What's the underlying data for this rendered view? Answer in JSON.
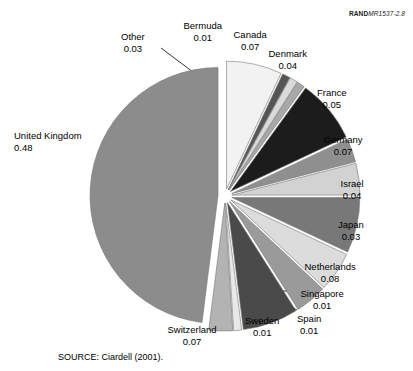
{
  "figure": {
    "rand_id_bold": "RAND",
    "rand_id_italic": "MR1537-2.8",
    "source_note": "SOURCE: Ciardell (2001)."
  },
  "chart_data": {
    "type": "pie",
    "title": "",
    "exploded": true,
    "start_angle_deg": 90,
    "direction": "counterclockwise",
    "categories": [
      "United Kingdom",
      "Other",
      "Bermuda",
      "Canada",
      "Denmark",
      "France",
      "Germany",
      "Israel",
      "Japan",
      "Netherlands",
      "Singapore",
      "Spain",
      "Sweden",
      "Switzerland"
    ],
    "values": [
      0.48,
      0.03,
      0.01,
      0.07,
      0.04,
      0.05,
      0.07,
      0.04,
      0.03,
      0.08,
      0.01,
      0.01,
      0.01,
      0.07
    ],
    "slices": [
      {
        "label": "United Kingdom",
        "value": 0.48,
        "value_text": "0.48",
        "color": "#8c8c8c"
      },
      {
        "label": "Other",
        "value": 0.03,
        "value_text": "0.03",
        "color": "#b3b3b3"
      },
      {
        "label": "Bermuda",
        "value": 0.01,
        "value_text": "0.01",
        "color": "#e8e8e8"
      },
      {
        "label": "Canada",
        "value": 0.07,
        "value_text": "0.07",
        "color": "#4a4a4a"
      },
      {
        "label": "Denmark",
        "value": 0.04,
        "value_text": "0.04",
        "color": "#9a9a9a"
      },
      {
        "label": "France",
        "value": 0.05,
        "value_text": "0.05",
        "color": "#dcdcdc"
      },
      {
        "label": "Germany",
        "value": 0.07,
        "value_text": "0.07",
        "color": "#787878"
      },
      {
        "label": "Israel",
        "value": 0.04,
        "value_text": "0.04",
        "color": "#d2d2d2"
      },
      {
        "label": "Japan",
        "value": 0.03,
        "value_text": "0.03",
        "color": "#8f8f8f"
      },
      {
        "label": "Netherlands",
        "value": 0.08,
        "value_text": "0.08",
        "color": "#1c1c1c"
      },
      {
        "label": "Singapore",
        "value": 0.01,
        "value_text": "0.01",
        "color": "#a8a8a8"
      },
      {
        "label": "Spain",
        "value": 0.01,
        "value_text": "0.01",
        "color": "#dadada"
      },
      {
        "label": "Sweden",
        "value": 0.01,
        "value_text": "0.01",
        "color": "#555555"
      },
      {
        "label": "Switzerland",
        "value": 0.07,
        "value_text": "0.07",
        "color": "#f2f2f2"
      }
    ],
    "geometry": {
      "cx": 225,
      "cy": 196,
      "radius": 128,
      "explode_offset": 7,
      "slice_stroke": "#ffffff",
      "slice_stroke_width": 1.4,
      "outline": "#777777",
      "outline_width": 0.6
    },
    "labels": [
      {
        "label": "United Kingdom",
        "x": 14,
        "y": 130,
        "align": "left"
      },
      {
        "label": "Other",
        "x": 133,
        "y": 31,
        "align": "center"
      },
      {
        "label": "Bermuda",
        "x": 203,
        "y": 20,
        "align": "center"
      },
      {
        "label": "Canada",
        "x": 250,
        "y": 29,
        "align": "center"
      },
      {
        "label": "Denmark",
        "x": 288,
        "y": 48,
        "align": "center"
      },
      {
        "label": "France",
        "x": 332,
        "y": 87,
        "align": "center"
      },
      {
        "label": "Germany",
        "x": 343,
        "y": 134,
        "align": "center"
      },
      {
        "label": "Israel",
        "x": 352,
        "y": 178,
        "align": "center"
      },
      {
        "label": "Japan",
        "x": 351,
        "y": 219,
        "align": "center"
      },
      {
        "label": "Netherlands",
        "x": 330,
        "y": 261,
        "align": "center"
      },
      {
        "label": "Singapore",
        "x": 322,
        "y": 288,
        "align": "center"
      },
      {
        "label": "Spain",
        "x": 309,
        "y": 313,
        "align": "center"
      },
      {
        "label": "Sweden",
        "x": 262,
        "y": 315,
        "align": "center"
      },
      {
        "label": "Switzerland",
        "x": 192,
        "y": 324,
        "align": "center"
      }
    ],
    "leader_lines": [
      {
        "label": "Other",
        "x1": 161,
        "y1": 48,
        "x2": 193,
        "y2": 72
      },
      {
        "label": "Singapore",
        "x1": 303,
        "y1": 291,
        "x2": 283,
        "y2": 291
      },
      {
        "label": "Spain",
        "x1": 297,
        "y1": 310,
        "x2": 274,
        "y2": 296
      },
      {
        "label": "Sweden",
        "x1": 265,
        "y1": 307,
        "x2": 257,
        "y2": 290
      }
    ]
  }
}
